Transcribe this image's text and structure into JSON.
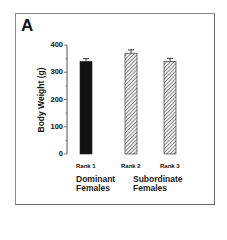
{
  "panel": {
    "letter": "A"
  },
  "chart_data": {
    "type": "bar",
    "title": "",
    "xlabel": "",
    "ylabel": "Body Weight (g)",
    "ylim": [
      0,
      400
    ],
    "yticks": [
      0,
      100,
      200,
      300,
      400
    ],
    "yticks_labels": [
      "0",
      "100",
      "200",
      "300",
      "400"
    ],
    "grid": false,
    "legend": null,
    "categories": [
      "Rank 1",
      "Rank 2",
      "Rank 3"
    ],
    "values": [
      340,
      370,
      340
    ],
    "errors": [
      10,
      12,
      11
    ],
    "bar_styles": [
      "solid-black",
      "hatched",
      "hatched"
    ],
    "groups": [
      {
        "label_line1": "Dominant",
        "label_line2": "Females",
        "categories": [
          "Rank 1"
        ]
      },
      {
        "label_line1": "Subordinate",
        "label_line2": "Females",
        "categories": [
          "Rank 2",
          "Rank 3"
        ]
      }
    ]
  },
  "colors": {
    "bar_solid": "#111111",
    "hatch": "#333333",
    "axis": "#555555",
    "frame": "#7a7a7a"
  }
}
